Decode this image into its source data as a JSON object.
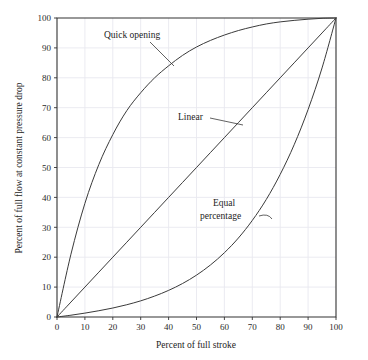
{
  "chart_data": {
    "type": "line",
    "title": "",
    "xlabel": "Percent of full stroke",
    "ylabel": "Percent of full flow at constant pressure drop",
    "xlim": [
      0,
      100
    ],
    "ylim": [
      0,
      100
    ],
    "grid": true,
    "legend_position": "inline-annotations",
    "xticks": [
      "0",
      "10",
      "20",
      "30",
      "40",
      "50",
      "60",
      "70",
      "80",
      "90",
      "100"
    ],
    "yticks": [
      "0",
      "10",
      "20",
      "30",
      "40",
      "50",
      "60",
      "70",
      "80",
      "90",
      "100"
    ],
    "x": [
      0,
      5,
      10,
      15,
      20,
      25,
      30,
      35,
      40,
      45,
      50,
      55,
      60,
      65,
      70,
      75,
      80,
      85,
      90,
      95,
      100
    ],
    "series": [
      {
        "name": "Quick opening",
        "label": "Quick opening",
        "values": [
          0,
          21,
          38,
          51,
          61,
          69,
          75,
          80,
          84,
          87.5,
          90.3,
          92.5,
          94.3,
          95.8,
          97,
          98,
          98.7,
          99.2,
          99.6,
          99.9,
          100
        ]
      },
      {
        "name": "Linear",
        "label": "Linear",
        "values": [
          0,
          5,
          10,
          15,
          20,
          25,
          30,
          35,
          40,
          45,
          50,
          55,
          60,
          65,
          70,
          75,
          80,
          85,
          90,
          95,
          100
        ]
      },
      {
        "name": "Equal percentage",
        "label": "Equal percentage",
        "values": [
          0,
          0.6,
          1.3,
          2.1,
          3.0,
          4.1,
          5.4,
          7.0,
          8.9,
          11.2,
          14.0,
          17.4,
          21.5,
          26.4,
          32.3,
          39.3,
          47.7,
          57.6,
          69.4,
          83.3,
          100
        ]
      }
    ],
    "annotations": [
      {
        "name": "quick-opening-annotation",
        "text": "Quick opening",
        "text_x": 104,
        "text_y": 38,
        "leader": "M 150 42 L 174 66"
      },
      {
        "name": "linear-annotation",
        "text": "Linear",
        "text_x": 178,
        "text_y": 120,
        "leader": "M 210 118 L 243 125"
      },
      {
        "name": "equal-percentage-annotation-line1",
        "text": "Equal",
        "text_x": 213,
        "text_y": 206,
        "leader": ""
      },
      {
        "name": "equal-percentage-annotation-line2",
        "text": "percentage",
        "text_x": 200,
        "text_y": 219,
        "leader": "M 259 216 Q 268 213 272 219"
      }
    ],
    "colors": {
      "curve": "#3a3a3a",
      "axis": "#333333",
      "grid": "#e9e9ef",
      "text": "#1d1d1d",
      "background": "#ffffff"
    }
  }
}
